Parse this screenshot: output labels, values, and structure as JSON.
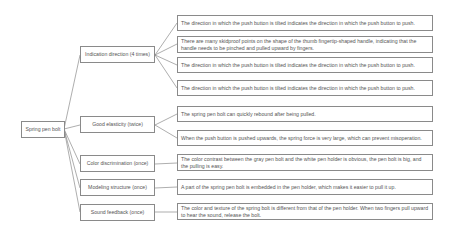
{
  "root": {
    "label": "Spring pen bolt"
  },
  "categories": [
    {
      "label": "Indication direction (4 times)"
    },
    {
      "label": "Good elasticity (twice)"
    },
    {
      "label": "Color discrimination (once)"
    },
    {
      "label": "Modeling structure (once)"
    },
    {
      "label": "Sound feedback (once)"
    }
  ],
  "leaves": [
    {
      "text": "The direction in which the push button is tilted indicates the direction in which the push button to push."
    },
    {
      "text": "There are many skidproof points on the shape of the thumb fingertip-shaped handle, indicating that the handle needs to be pinched and pulled upward by fingers."
    },
    {
      "text": "The direction in which the push button is tilted indicates the direction in which the push button to push."
    },
    {
      "text": "The direction in which the push button is tilted indicates the direction in which the push button to push."
    },
    {
      "text": "The spring pen bolt can quickly rebound after being pulled."
    },
    {
      "text": "When the push button is pushed upwards, the spring force is very large, which can prevent misoperation."
    },
    {
      "text": "The color contrast between the gray pen bolt and the white pen holder is obvious, the pen bolt is big, and the pulling is easy."
    },
    {
      "text": "A part of the spring pen bolt is embedded in the pen holder, which makes it easier to pull it up."
    },
    {
      "text": "The color and texture of the spring bolt is different from that of the pen holder. When two fingers pull upward to hear the sound, release the bolt."
    }
  ]
}
